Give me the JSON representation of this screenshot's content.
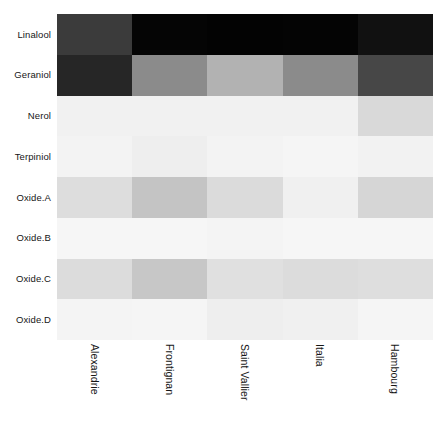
{
  "chart_data": {
    "type": "heatmap",
    "title": "",
    "xlabel": "",
    "ylabel": "",
    "grid": false,
    "legend": "none",
    "colormap": "greys",
    "colormap_note": "low value = white/light grey, high value = black",
    "value_range": [
      0,
      1
    ],
    "categories": [
      "Alexandrie",
      "Frontignan",
      "Saint Vallier",
      "Italia",
      "Hambourg"
    ],
    "rows": [
      "Linalool",
      "Geraniol",
      "Nerol",
      "Terpiniol",
      "Oxide.A",
      "Oxide.B",
      "Oxide.C",
      "Oxide.D"
    ],
    "series": [
      {
        "name": "Linalool",
        "values": [
          0.77,
          1.0,
          1.0,
          1.0,
          0.96
        ]
      },
      {
        "name": "Geraniol",
        "values": [
          0.86,
          0.46,
          0.31,
          0.46,
          0.72
        ]
      },
      {
        "name": "Nerol",
        "values": [
          0.05,
          0.05,
          0.05,
          0.05,
          0.15
        ]
      },
      {
        "name": "Terpiniol",
        "values": [
          0.04,
          0.06,
          0.04,
          0.03,
          0.05
        ]
      },
      {
        "name": "Oxide.A",
        "values": [
          0.13,
          0.23,
          0.14,
          0.05,
          0.17
        ]
      },
      {
        "name": "Oxide.B",
        "values": [
          0.03,
          0.03,
          0.04,
          0.03,
          0.03
        ]
      },
      {
        "name": "Oxide.C",
        "values": [
          0.14,
          0.22,
          0.12,
          0.14,
          0.13
        ]
      },
      {
        "name": "Oxide.D",
        "values": [
          0.04,
          0.04,
          0.07,
          0.06,
          0.04
        ]
      }
    ],
    "cell_colors": [
      [
        "#3b3b3b",
        "#050505",
        "#030303",
        "#040404",
        "#111111"
      ],
      [
        "#262626",
        "#8b8b8b",
        "#b2b2b2",
        "#8b8b8b",
        "#474747"
      ],
      [
        "#f1f1f1",
        "#f1f1f1",
        "#f1f1f1",
        "#f1f1f1",
        "#d9d9d9"
      ],
      [
        "#f3f3f3",
        "#eeeeee",
        "#f3f3f3",
        "#f5f5f5",
        "#f2f2f2"
      ],
      [
        "#dddddd",
        "#c4c4c4",
        "#dbdbdb",
        "#f0f0f0",
        "#d6d6d6"
      ],
      [
        "#f6f6f6",
        "#f6f6f6",
        "#f4f4f4",
        "#f6f6f6",
        "#f6f6f6"
      ],
      [
        "#dcdcdc",
        "#c7c7c7",
        "#e0e0e0",
        "#dcdcdc",
        "#dedede"
      ],
      [
        "#f4f4f4",
        "#f5f5f5",
        "#eeeeee",
        "#f0f0f0",
        "#f5f5f5"
      ]
    ]
  },
  "axes": {
    "row_labels": [
      "Linalool",
      "Geraniol",
      "Nerol",
      "Terpiniol",
      "Oxide.A",
      "Oxide.B",
      "Oxide.C",
      "Oxide.D"
    ],
    "column_labels": [
      "Alexandrie",
      "Frontignan",
      "Saint Vallier",
      "Italia",
      "Hambourg"
    ]
  },
  "style": {
    "background": "#ffffff",
    "text_color": "#161616"
  }
}
